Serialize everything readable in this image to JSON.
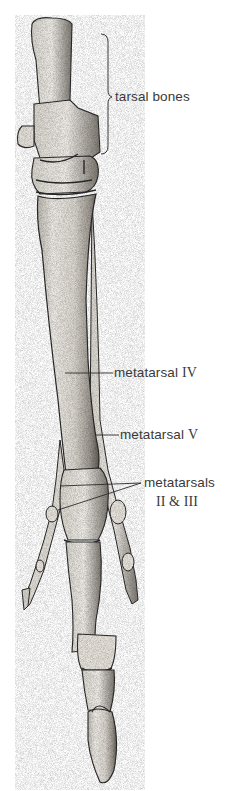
{
  "figure": {
    "colors": {
      "background": "#ffffff",
      "bone_fill": "#e9e6e0",
      "bone_shade": "#8f8a82",
      "outline": "#2a2a2a",
      "label_text": "#3a3a3a"
    },
    "labels": [
      {
        "id": "tarsal",
        "text": "tarsal bones"
      },
      {
        "id": "mt4",
        "text": "metatarsal",
        "numeral": "IV"
      },
      {
        "id": "mt5",
        "text": "metatarsal",
        "numeral": "V"
      },
      {
        "id": "mt23",
        "text": "metatarsals",
        "line2": "II & III"
      }
    ]
  }
}
